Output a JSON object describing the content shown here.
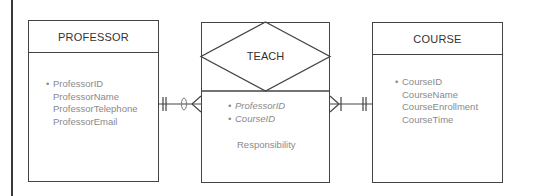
{
  "diagram": {
    "type": "er-diagram",
    "line_color": "#444444",
    "text_color": "#8a8a8a",
    "entities": [
      {
        "name": "PROFESSOR",
        "attributes": [
          {
            "label": "ProfessorID",
            "key": true
          },
          {
            "label": "ProfessorName",
            "key": false
          },
          {
            "label": "ProfessorTelephone",
            "key": false
          },
          {
            "label": "ProfessorEmail",
            "key": false
          }
        ]
      },
      {
        "name": "COURSE",
        "attributes": [
          {
            "label": "CourseID",
            "key": true
          },
          {
            "label": "CourseName",
            "key": false
          },
          {
            "label": "CourseEnrollment",
            "key": false
          },
          {
            "label": "CourseTime",
            "key": false
          }
        ]
      }
    ],
    "relationship": {
      "name": "TEACH",
      "attributes": [
        {
          "label": "ProfessorID",
          "key": true,
          "foreign": true
        },
        {
          "label": "CourseID",
          "key": true,
          "foreign": true
        },
        {
          "label": "Responsibility",
          "key": false,
          "foreign": false
        }
      ]
    },
    "connectors": [
      {
        "from": "PROFESSOR",
        "to": "TEACH",
        "from_cardinality": "one-and-only-one",
        "to_cardinality": "zero-or-many"
      },
      {
        "from": "TEACH",
        "to": "COURSE",
        "from_cardinality": "one-or-many",
        "to_cardinality": "one-and-only-one"
      }
    ],
    "bullet": "•"
  }
}
